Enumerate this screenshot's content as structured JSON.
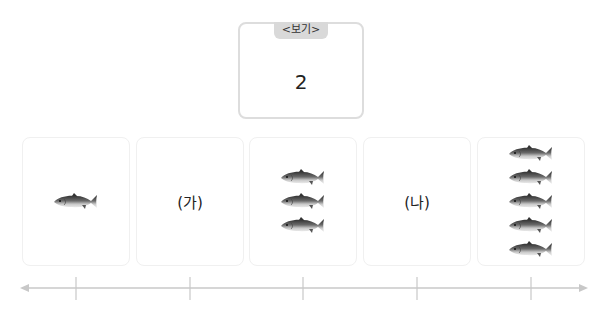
{
  "example": {
    "tab_label": "<보기>",
    "value": "2"
  },
  "cards": [
    {
      "type": "fish",
      "count": 1,
      "label": ""
    },
    {
      "type": "label",
      "count": 0,
      "label": "(가)"
    },
    {
      "type": "fish",
      "count": 3,
      "label": ""
    },
    {
      "type": "label",
      "count": 0,
      "label": "(나)"
    },
    {
      "type": "fish",
      "count": 5,
      "label": ""
    }
  ],
  "number_line": {
    "ticks": 5,
    "arrows": "both",
    "color": "#c8c8c8"
  },
  "icons": {
    "fish": "mackerel-fish-icon"
  }
}
